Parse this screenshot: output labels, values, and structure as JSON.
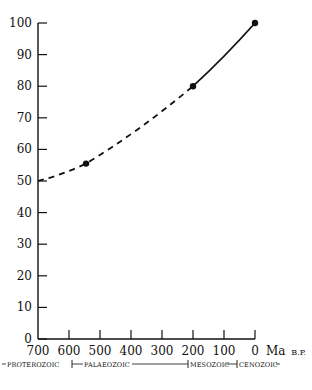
{
  "chart_data": {
    "type": "line",
    "title": "",
    "xlabel": "Ma B.P.",
    "ylabel": "",
    "xlim": [
      700,
      0
    ],
    "ylim": [
      0,
      100
    ],
    "x_reversed": true,
    "x_ticks": [
      700,
      600,
      500,
      400,
      300,
      200,
      100,
      0
    ],
    "y_ticks": [
      0,
      10,
      20,
      30,
      40,
      50,
      60,
      70,
      80,
      90,
      100
    ],
    "grid": false,
    "legend": null,
    "series": [
      {
        "name": "extrapolated curve (dashed)",
        "style": "dashed",
        "x": [
          700,
          545,
          200
        ],
        "y": [
          50,
          55.5,
          80
        ]
      },
      {
        "name": "curve (solid)",
        "style": "solid",
        "x": [
          200,
          0
        ],
        "y": [
          80,
          100
        ]
      }
    ],
    "points": [
      {
        "x": 545,
        "y": 55.5
      },
      {
        "x": 200,
        "y": 80
      },
      {
        "x": 0,
        "y": 100
      }
    ],
    "annotations": {
      "eras": [
        {
          "label": "PROTEROZOIC",
          "from": 700,
          "to": 590
        },
        {
          "label": "PALAEOZOIC",
          "from": 590,
          "to": 220
        },
        {
          "label": "MESOZOIC",
          "from": 220,
          "to": 60
        },
        {
          "label": "CENOZOIC",
          "from": 60,
          "to": 0
        }
      ]
    }
  },
  "axis": {
    "x_unit_main": "Ma",
    "x_unit_suffix": "B.P."
  }
}
